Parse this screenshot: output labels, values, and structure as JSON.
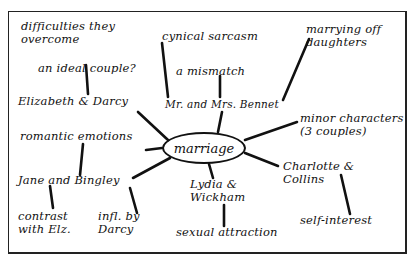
{
  "diagram": {
    "type": "mind-map",
    "center": {
      "label": "marriage"
    },
    "nodes": {
      "elizabeth_darcy": "Elizabeth & Darcy",
      "difficulties": "difficulties they\novercome",
      "ideal_couple": "an ideal couple?",
      "romantic": "romantic emotions",
      "jane_bingley": "Jane and Bingley",
      "contrast": "contrast\nwith Elz.",
      "infl_darcy": "infl. by\nDarcy",
      "bennet": "Mr. and Mrs. Bennet",
      "cynical": "cynical sarcasm",
      "mismatch": "a mismatch",
      "marrying_off": "marrying off\ndaughters",
      "minor": "minor characters\n(3 couples)",
      "charlotte": "Charlotte &\nCollins",
      "self_interest": "self-interest",
      "lydia": "Lydia &\nWickham",
      "sexual": "sexual attraction"
    },
    "colors": {
      "ink": "#111111",
      "paper": "#ffffff"
    }
  }
}
